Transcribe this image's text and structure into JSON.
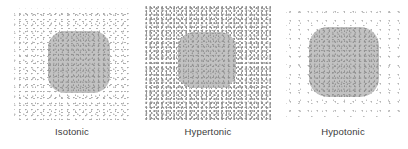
{
  "figure": {
    "panel_count": 3,
    "colors": {
      "background": "#ffffff",
      "cell_fill": "#c2c2c2",
      "solute_dot": "#909090",
      "caption_text": "#3b3b3b"
    }
  },
  "panels": [
    {
      "id": "isotonic",
      "caption": "Isotonic",
      "solute_density": "moderate",
      "cell_state": "normal"
    },
    {
      "id": "hypertonic",
      "caption": "Hypertonic",
      "solute_density": "high",
      "cell_state": "shrunken"
    },
    {
      "id": "hypotonic",
      "caption": "Hypotonic",
      "solute_density": "low",
      "cell_state": "swollen"
    }
  ]
}
